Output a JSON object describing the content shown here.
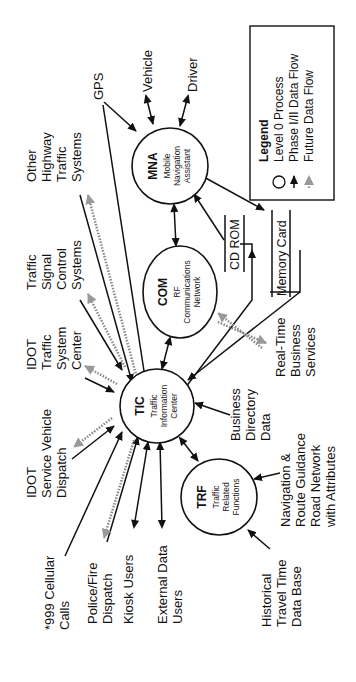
{
  "diagram": {
    "orientation": "rotated 90deg counterclockwise",
    "processes": {
      "mna": {
        "code": "MNA",
        "line1": "Mobile",
        "line2": "Navigation",
        "line3": "Assistant"
      },
      "com": {
        "code": "COM",
        "line1": "RF",
        "line2": "Communications",
        "line3": "Network"
      },
      "tic": {
        "code": "TIC",
        "line1": "Traffic",
        "line2": "Information",
        "line3": "Center"
      },
      "trf": {
        "code": "TRF",
        "line1": "Traffic",
        "line2": "Related",
        "line3": "Functions"
      }
    },
    "stores": {
      "cdrom": "CD ROM",
      "memory_card": "Memory Card"
    },
    "externals": {
      "gps": [
        "GPS"
      ],
      "vehicle": [
        "Vehicle"
      ],
      "driver": [
        "Driver"
      ],
      "other_highway": [
        "Other",
        "Highway",
        "Traffic",
        "Systems"
      ],
      "traffic_signal": [
        "Traffic",
        "Signal",
        "Control",
        "Systems"
      ],
      "idot_tsc": [
        "IDOT",
        "Traffic",
        "System",
        "Center"
      ],
      "idot_svd": [
        "IDOT",
        "Service Vehicle",
        "Dispatch"
      ],
      "cellular": [
        "*999 Cellular",
        "Calls"
      ],
      "police": [
        "Police/Fire",
        "Dispatch"
      ],
      "kiosk": [
        "Kiosk Users"
      ],
      "external_data": [
        "External Data",
        "Users"
      ],
      "historical": [
        "Historical",
        "Travel Time",
        "Data Base"
      ],
      "nav_route": [
        "Navigation &",
        "Route Guidance",
        "Road Network",
        "with Attributes"
      ],
      "business_dir": [
        "Business",
        "Directory",
        "Data"
      ],
      "realtime_business": [
        "Real-Time",
        "Business",
        "Services"
      ]
    },
    "legend": {
      "title": "Legend",
      "items": [
        {
          "symbol": "circle",
          "label": "Level 0 Process"
        },
        {
          "symbol": "solid-arrow",
          "label": "Phase I/II Data Flow"
        },
        {
          "symbol": "dotted-arrow",
          "label": "Future Data Flow"
        }
      ]
    },
    "colors": {
      "solid_flow": "#111111",
      "future_flow": "#888888",
      "background": "#ffffff"
    }
  }
}
